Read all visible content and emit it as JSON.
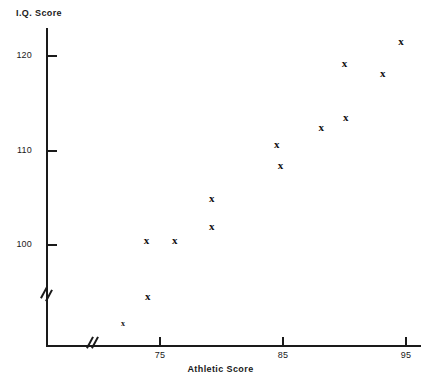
{
  "chart_data": {
    "type": "scatter",
    "title": "",
    "xlabel": "Athletic Score",
    "ylabel": "I.Q. Score",
    "xticks": [
      75,
      85,
      95
    ],
    "xtick_labels": [
      "75",
      "85",
      "95"
    ],
    "yticks": [
      100,
      110,
      120
    ],
    "ytick_labels": [
      "100",
      "110",
      "120"
    ],
    "xlim": [
      71.5,
      96.2
    ],
    "ylim": [
      89.5,
      123.5
    ],
    "grid": false,
    "legend": null,
    "axis_breaks": {
      "x": true,
      "y": true
    },
    "marker": "x",
    "points": [
      {
        "x": 74.0,
        "y": 94.5,
        "marker": "x"
      },
      {
        "x": 73.9,
        "y": 100.4,
        "marker": "x"
      },
      {
        "x": 76.2,
        "y": 100.4,
        "marker": "x"
      },
      {
        "x": 79.2,
        "y": 101.9,
        "marker": "x"
      },
      {
        "x": 79.2,
        "y": 104.9,
        "marker": "x"
      },
      {
        "x": 84.8,
        "y": 108.4,
        "marker": "x"
      },
      {
        "x": 84.5,
        "y": 110.6,
        "marker": "x"
      },
      {
        "x": 88.1,
        "y": 112.4,
        "marker": "x"
      },
      {
        "x": 90.1,
        "y": 113.4,
        "marker": "x"
      },
      {
        "x": 90.0,
        "y": 119.2,
        "marker": "x"
      },
      {
        "x": 93.1,
        "y": 118.1,
        "marker": "x"
      },
      {
        "x": 94.6,
        "y": 121.5,
        "marker": "x"
      },
      {
        "x": 72.0,
        "y": 91.4,
        "marker": "x",
        "size": "small"
      }
    ]
  },
  "colors": {
    "axis": "#1a1a1a",
    "marker": "#111111",
    "background": "#ffffff"
  },
  "axes": {
    "y_title": "I.Q. Score",
    "x_title": "Athletic Score"
  }
}
